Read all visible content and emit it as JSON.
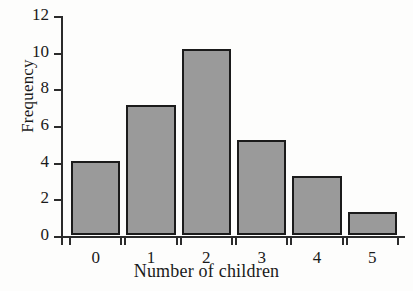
{
  "chart_data": {
    "type": "bar",
    "title": "",
    "xlabel": "Number of children",
    "ylabel": "Frequency",
    "categories": [
      "0",
      "1",
      "2",
      "3",
      "4",
      "5"
    ],
    "values": [
      4.05,
      7.1,
      10.15,
      5.2,
      3.2,
      1.25
    ],
    "ylim": [
      0,
      12
    ],
    "yticks": [
      "0",
      "2",
      "4",
      "6",
      "8",
      "10",
      "12"
    ],
    "ytick_values": [
      0,
      2,
      4,
      6,
      8,
      10,
      12
    ],
    "grid": false,
    "legend": null,
    "bar_fill_color": "#9a9a9a",
    "bar_edge_color": "#1b1b1b",
    "axis_color": "#2b2b2b",
    "background_color": "#fdfdfc"
  }
}
